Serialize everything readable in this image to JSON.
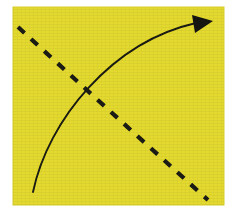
{
  "canvas": {
    "width": 242,
    "height": 220,
    "background_color": "#ffffff",
    "title": "Curved arrow crossing a dashed diagonal on a yellow square"
  },
  "panel": {
    "label": "yellow-square-panel",
    "fill_color": "#e3d92f",
    "edge_color": "#d8cd2a",
    "x": 13,
    "y": 7,
    "width": 211,
    "height": 198
  },
  "shapes": {
    "solid_curve": {
      "label": "curved-arrow",
      "stroke_color": "#1a1a12",
      "stroke_width": 1.9,
      "style": "solid",
      "start_point": [
        33,
        192
      ],
      "end_point": [
        196,
        23
      ],
      "control_point_1": [
        48,
        120
      ],
      "control_point_2": [
        112,
        42
      ],
      "direction": "bottom-left to top-right",
      "curvature": "concave-up"
    },
    "arrow_head": {
      "label": "arrow-head",
      "fill_color": "#141410",
      "shape": "solid-triangle",
      "tip_point": [
        213,
        21
      ],
      "base_points": [
        [
          192,
          15
        ],
        [
          195,
          33
        ]
      ],
      "points_toward": "upper-right"
    },
    "dashed_line": {
      "label": "dashed-diagonal",
      "stroke_color": "#1a1a12",
      "stroke_width": 4.2,
      "style": "dashed",
      "dash_length": 9,
      "gap_length": 9,
      "dash_count": 11,
      "start_point": [
        18,
        27
      ],
      "end_point": [
        208,
        200
      ],
      "control_point": [
        104,
        106
      ],
      "direction": "upper-left to lower-right"
    },
    "intersection": {
      "label": "curve-dash-crossing",
      "point": [
        87,
        95
      ]
    }
  },
  "legend": {
    "solid_label": "",
    "dashed_label": "",
    "caption": ""
  }
}
